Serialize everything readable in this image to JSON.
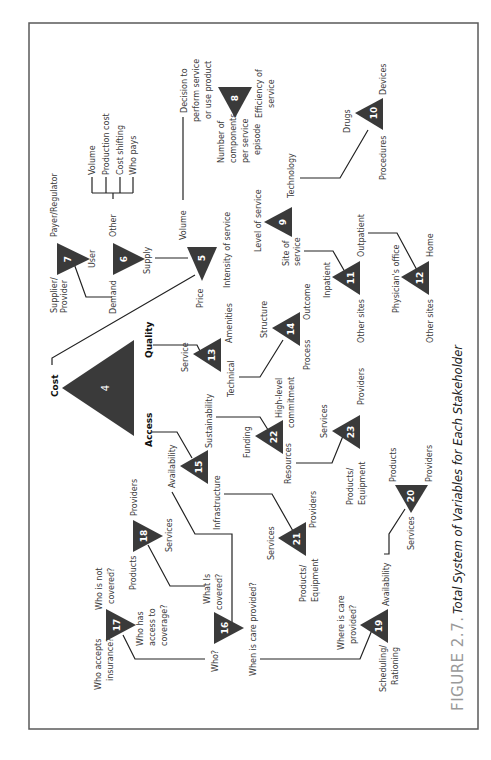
{
  "figure": {
    "label": "FIGURE 2.7.",
    "title": "Total System of Variables for Each Stakeholder"
  },
  "nodes": {
    "n4": {
      "num": "4",
      "labels": {
        "cost": "Cost",
        "quality": "Quality",
        "access": "Access"
      }
    },
    "n5": {
      "num": "5",
      "labels": {
        "volume": "Volume",
        "price": "Price",
        "intensity": "Intensity of service"
      }
    },
    "n6": {
      "num": "6",
      "labels": {
        "other": "Other",
        "demand": "Demand",
        "supply": "Supply"
      }
    },
    "n7": {
      "num": "7",
      "labels": {
        "payer": "Payer/Regulator",
        "supplier1": "Supplier/",
        "supplier2": "Provider",
        "user": "User"
      }
    },
    "n8": {
      "num": "8",
      "labels": {
        "decision1": "Decision to",
        "decision2": "perform service",
        "decision3": "or use product",
        "components1": "Number of",
        "components2": "components",
        "components3": "per service",
        "components4": "episode",
        "efficiency1": "Efficiency of",
        "efficiency2": "service"
      }
    },
    "n9": {
      "num": "9",
      "labels": {
        "level": "Level of service",
        "technology": "Technology",
        "site1": "Site of",
        "site2": "service"
      }
    },
    "n10": {
      "num": "10",
      "labels": {
        "drugs": "Drugs",
        "devices": "Devices",
        "procedures": "Procedures"
      }
    },
    "n11": {
      "num": "11",
      "labels": {
        "inpatient": "Inpatient",
        "outpatient": "Outpatient",
        "other": "Other sites"
      }
    },
    "n12": {
      "num": "12",
      "labels": {
        "physician": "Physician's office",
        "home": "Home",
        "other": "Other sites"
      }
    },
    "n13": {
      "num": "13",
      "labels": {
        "service": "Service",
        "amenities": "Amenities",
        "technical": "Technical"
      }
    },
    "n14": {
      "num": "14",
      "labels": {
        "structure": "Structure",
        "outcome": "Outcome",
        "process": "Process"
      }
    },
    "n15": {
      "num": "15",
      "labels": {
        "availability": "Availability",
        "sustainability": "Sustainability",
        "infrastructure": "Infrastructure"
      }
    },
    "n16": {
      "num": "16",
      "labels": {
        "who": "Who?",
        "what1": "What Is",
        "what2": "covered?",
        "when": "When is care provided?"
      }
    },
    "n17": {
      "num": "17",
      "labels": {
        "accepts1": "Who accepts",
        "accepts2": "insurance?",
        "notcovered1": "Who is not",
        "notcovered2": "covered?",
        "access1": "Who has",
        "access2": "access to",
        "access3": "coverage?"
      }
    },
    "n18": {
      "num": "18",
      "labels": {
        "products": "Products",
        "providers": "Providers",
        "services": "Services"
      }
    },
    "n19": {
      "num": "19",
      "labels": {
        "where1": "Where is care",
        "where2": "provided?",
        "availability": "Availability",
        "sched1": "Scheduling/",
        "sched2": "Rationing"
      }
    },
    "n20": {
      "num": "20",
      "labels": {
        "products": "Products",
        "providers": "Providers",
        "services": "Services"
      }
    },
    "n21": {
      "num": "21",
      "labels": {
        "services": "Services",
        "providers": "Providers",
        "products1": "Products/",
        "products2": "Equipment"
      }
    },
    "n22": {
      "num": "22",
      "labels": {
        "funding": "Funding",
        "commit1": "High-level",
        "commit2": "commitment",
        "resources": "Resources"
      }
    },
    "n23": {
      "num": "23",
      "labels": {
        "services": "Services",
        "providers": "Providers",
        "products1": "Products/",
        "products2": "Equipment"
      }
    }
  },
  "other_branch": [
    "Volume",
    "Production cost",
    "Cost shifting",
    "Who pays"
  ],
  "colors": {
    "triangle": "#3a3a3a",
    "text": "#3a3a3a",
    "frame": "#5a5a5a",
    "figure_label": "#9a9a9a"
  }
}
